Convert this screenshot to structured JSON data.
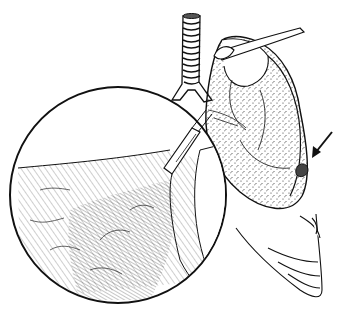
{
  "illustration": {
    "subject": "Lung with magnified circular inset showing bronchial airway and alveolar tissue",
    "style": "black-and-white pen-and-ink medical illustration",
    "colors": {
      "ink": "#111111",
      "background": "#ffffff",
      "stipple": "#333333"
    },
    "elements": {
      "trachea": "trachea with cartilage rings",
      "lung": "lung lobes with stippled surface",
      "vessel": "vessel crossing over apex",
      "lesion": "small nodular lesion on lung surface",
      "arrow": "arrow pointing to lesion",
      "inset": "magnified circular inset",
      "airway": "bronchiole entering tissue in inset",
      "tissue": "hatched alveolar tissue in inset",
      "ribs": "lower rib-like lobes"
    },
    "inset_circle": {
      "cx": 118,
      "cy": 195,
      "r": 108
    }
  }
}
